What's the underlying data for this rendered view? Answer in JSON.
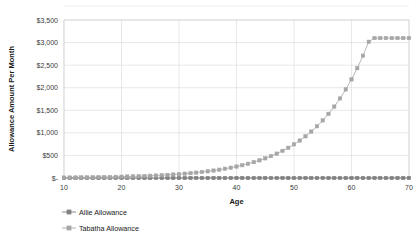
{
  "chart_data": {
    "type": "line",
    "title": "",
    "xlabel": "Age",
    "ylabel": "Allowance Amount Per Month",
    "xlim": [
      10,
      70
    ],
    "ylim": [
      0,
      3500
    ],
    "xticks": [
      "10",
      "20",
      "30",
      "40",
      "50",
      "60",
      "70"
    ],
    "xtick_values": [
      10,
      20,
      30,
      40,
      50,
      60,
      70
    ],
    "yticks": [
      "$-",
      "$500",
      "$1,000",
      "$1,500",
      "$2,000",
      "$2,500",
      "$3,000",
      "$3,500"
    ],
    "ytick_values": [
      0,
      500,
      1000,
      1500,
      2000,
      2500,
      3000,
      3500
    ],
    "grid": true,
    "legend_position": "bottom-left",
    "x": [
      10,
      11,
      12,
      13,
      14,
      15,
      16,
      17,
      18,
      19,
      20,
      21,
      22,
      23,
      24,
      25,
      26,
      27,
      28,
      29,
      30,
      31,
      32,
      33,
      34,
      35,
      36,
      37,
      38,
      39,
      40,
      41,
      42,
      43,
      44,
      45,
      46,
      47,
      48,
      49,
      50,
      51,
      52,
      53,
      54,
      55,
      56,
      57,
      58,
      59,
      60,
      61,
      62,
      63,
      64,
      65,
      66,
      67,
      68,
      69,
      70
    ],
    "series": [
      {
        "name": "Allie Allowance",
        "color": "#808080",
        "marker": "square",
        "values": [
          0,
          0,
          0,
          0,
          0,
          0,
          0,
          0,
          0,
          0,
          0,
          0,
          0,
          0,
          0,
          0,
          0,
          0,
          0,
          0,
          0,
          0,
          0,
          0,
          0,
          0,
          0,
          0,
          0,
          0,
          0,
          0,
          0,
          0,
          0,
          0,
          0,
          0,
          0,
          0,
          0,
          0,
          0,
          0,
          0,
          0,
          0,
          0,
          0,
          0,
          0,
          0,
          0,
          0,
          0,
          0,
          0,
          0,
          0,
          0,
          0
        ]
      },
      {
        "name": "Tabatha Allowance",
        "color": "#a6a6a6",
        "marker": "square",
        "values": [
          10,
          11,
          12,
          14,
          15,
          17,
          19,
          21,
          23,
          26,
          29,
          32,
          36,
          40,
          45,
          50,
          56,
          62,
          69,
          77,
          86,
          96,
          107,
          119,
          133,
          148,
          165,
          184,
          205,
          228,
          254,
          283,
          315,
          351,
          391,
          435,
          485,
          540,
          601,
          669,
          745,
          830,
          924,
          1029,
          1146,
          1276,
          1421,
          1582,
          1762,
          1962,
          2185,
          2433,
          2710,
          3018,
          3100,
          3100,
          3100,
          3100,
          3100,
          3100,
          3100
        ]
      }
    ]
  },
  "legend": {
    "items": [
      {
        "label": "Allie Allowance"
      },
      {
        "label": "Tabatha Allowance"
      }
    ]
  }
}
